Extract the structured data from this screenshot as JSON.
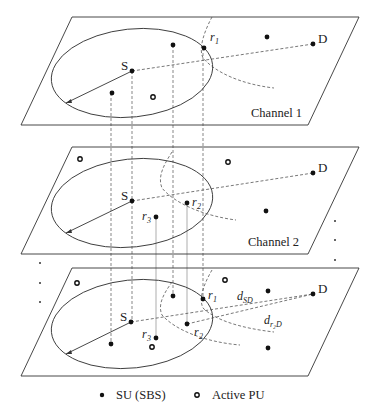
{
  "diagram": {
    "planes": [
      {
        "id": "channel-1",
        "label": "Channel 1",
        "top_y": 17
      },
      {
        "id": "channel-2",
        "label": "Channel 2",
        "top_y": 147
      },
      {
        "id": "combined",
        "label": "",
        "top_y": 268
      }
    ],
    "node_labels": {
      "source": "S",
      "destination": "D",
      "relay1": "r",
      "relay1_sub": "1",
      "relay2": "r",
      "relay2_sub": "2",
      "relay3": "r",
      "relay3_sub": "3",
      "d_sd": "d",
      "d_sd_sub": "SD",
      "d_r2d": "d",
      "d_r2d_sub": "r₂D"
    },
    "legend": {
      "su_label": "SU (SBS)",
      "pu_label": "Active PU"
    },
    "colors": {
      "line": "#333333",
      "node": "#111111",
      "background": "#ffffff"
    }
  }
}
